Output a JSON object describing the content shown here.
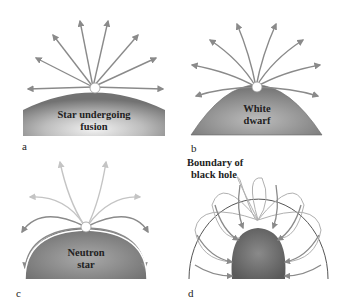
{
  "panels": [
    {
      "id": "a",
      "letter": "a",
      "label_line1": "Star undergoing",
      "label_line2": "fusion"
    },
    {
      "id": "b",
      "letter": "b",
      "label_line1": "White",
      "label_line2": "dwarf"
    },
    {
      "id": "c",
      "letter": "c",
      "label_line1": "Neutron",
      "label_line2": "star"
    },
    {
      "id": "d",
      "letter": "d",
      "label_line1": "Boundary of",
      "label_line2": "black hole"
    }
  ],
  "colors": {
    "arrow": "#8a8a8a",
    "arrow_faint": "#c4c4c4",
    "body_dark": "#6e6e6e",
    "body_light": "#d8d8d8",
    "boundary": "#555555"
  }
}
